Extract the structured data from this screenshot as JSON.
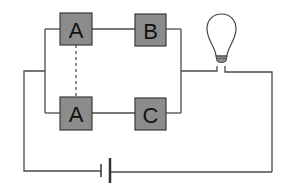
{
  "diagram": {
    "type": "circuit",
    "components": [
      {
        "id": "box-a-top",
        "label": "A",
        "kind": "component-box"
      },
      {
        "id": "box-b",
        "label": "B",
        "kind": "component-box"
      },
      {
        "id": "box-a-bottom",
        "label": "A",
        "kind": "component-box"
      },
      {
        "id": "box-c",
        "label": "C",
        "kind": "component-box"
      },
      {
        "id": "lamp",
        "label": "",
        "kind": "light-bulb"
      },
      {
        "id": "battery",
        "label": "",
        "kind": "cell"
      }
    ],
    "links": [
      {
        "from": "box-a-top",
        "to": "box-a-bottom",
        "style": "dashed"
      }
    ],
    "colors": {
      "box_fill": "#8c8c8c",
      "wire": "#4a4a4a",
      "background": "#ffffff"
    }
  }
}
